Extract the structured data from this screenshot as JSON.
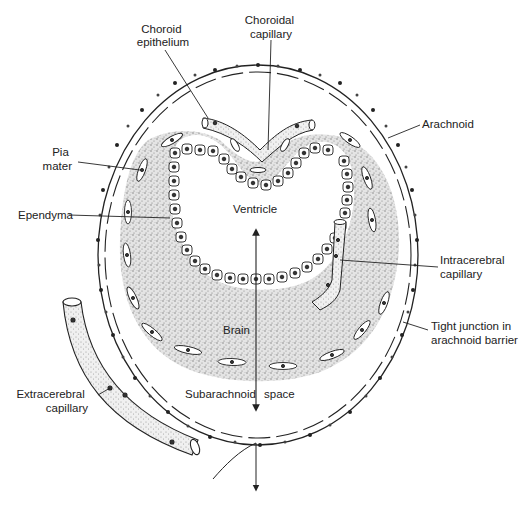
{
  "figure": {
    "labels": {
      "choroid_epithelium": [
        "Choroid",
        "epithelium"
      ],
      "choroidal_capillary": [
        "Choroidal",
        "capillary"
      ],
      "arachnoid": "Arachnoid",
      "pia_mater": [
        "Pia",
        "mater"
      ],
      "ependyma": "Ependyma",
      "ventricle": "Ventricle",
      "intracerebral_capillary": [
        "Intracerebral",
        "capillary"
      ],
      "brain": "Brain",
      "tight_junction": [
        "Tight junction in",
        "arachnoid barrier"
      ],
      "extracerebral_capillary": [
        "Extracerebral",
        "capillary"
      ],
      "subarachnoid": "Subarachnoid",
      "space": "space"
    },
    "colors": {
      "ink": "#222222",
      "brain_stipple": "#9a9a9a",
      "background": "#ffffff"
    }
  }
}
